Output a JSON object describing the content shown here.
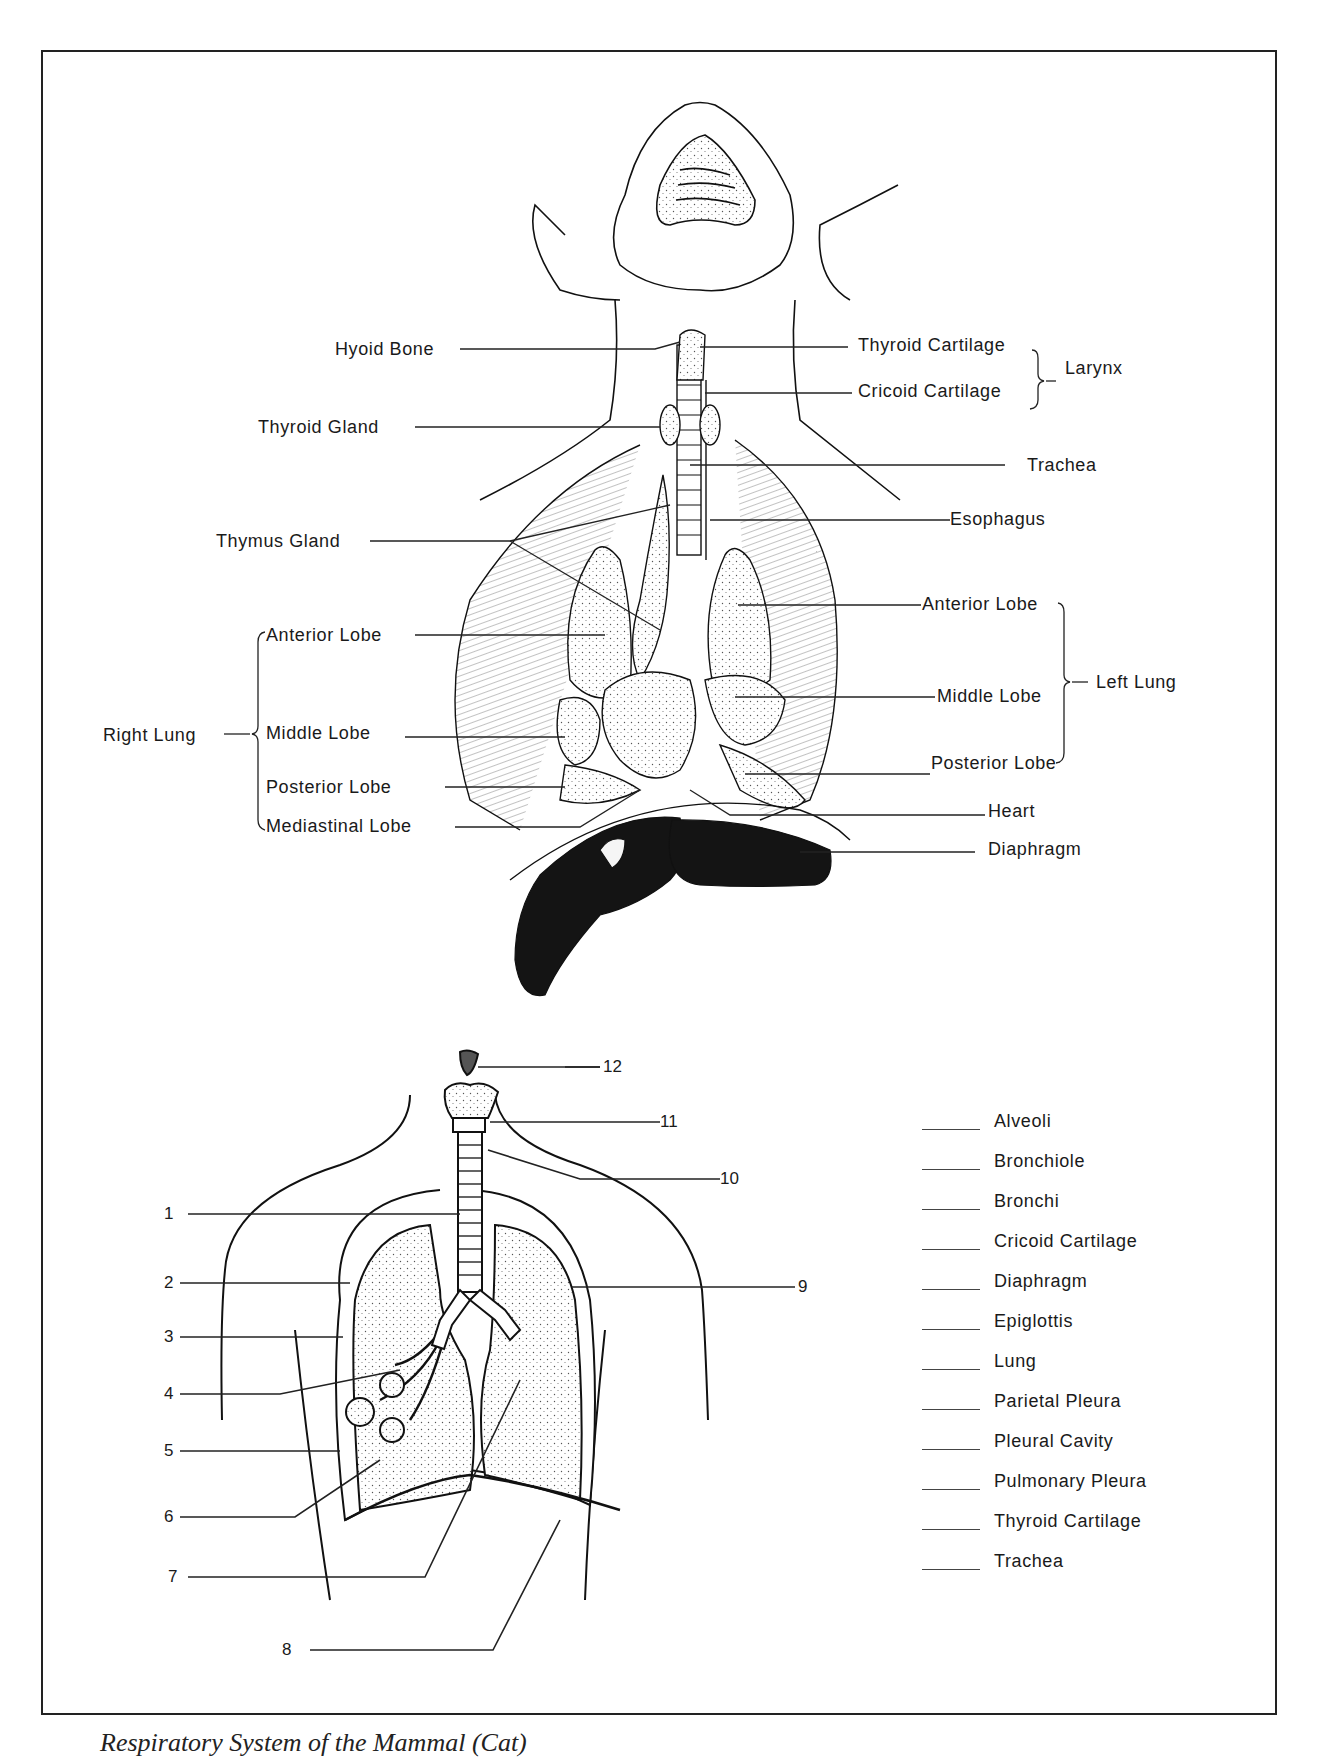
{
  "figure": {
    "caption_partial": "Respiratory System of the Mammal (Cat)"
  },
  "cat_diagram": {
    "left_labels": {
      "hyoid_bone": "Hyoid Bone",
      "thyroid_gland": "Thyroid Gland",
      "thymus_gland": "Thymus Gland"
    },
    "right_labels": {
      "thyroid_cartilage": "Thyroid Cartilage",
      "cricoid_cartilage": "Cricoid Cartilage",
      "larynx": "Larynx",
      "trachea": "Trachea",
      "esophagus": "Esophagus",
      "heart": "Heart",
      "diaphragm": "Diaphragm"
    },
    "right_lung": {
      "group_label": "Right Lung",
      "lobes": [
        "Anterior Lobe",
        "Middle Lobe",
        "Posterior Lobe",
        "Mediastinal Lobe"
      ]
    },
    "left_lung": {
      "group_label": "Left Lung",
      "lobes": [
        "Anterior Lobe",
        "Middle Lobe",
        "Posterior Lobe"
      ]
    }
  },
  "human_diagram": {
    "numbers": [
      "1",
      "2",
      "3",
      "4",
      "5",
      "6",
      "7",
      "8",
      "9",
      "10",
      "11",
      "12"
    ]
  },
  "answer_key": {
    "terms": [
      "Alveoli",
      "Bronchiole",
      "Bronchi",
      "Cricoid Cartilage",
      "Diaphragm",
      "Epiglottis",
      "Lung",
      "Parietal Pleura",
      "Pleural Cavity",
      "Pulmonary Pleura",
      "Thyroid Cartilage",
      "Trachea"
    ]
  }
}
